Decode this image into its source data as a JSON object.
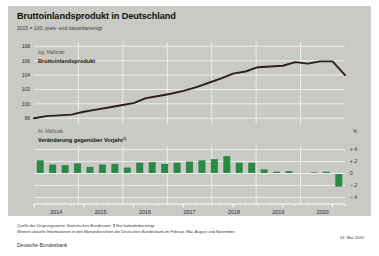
{
  "header": {
    "title": "Bruttoinlandsprodukt in Deutschland",
    "subtitle": "2015 = 100, preis- und saisonbereinigt"
  },
  "footer": {
    "source_prefix": "Quelle der Ursprungswerte: Statistisches Bundesamt.",
    "footnote_marker": "1",
    "footnote_text": "Nur kalenderbereinigt.",
    "source_line2": "Weitere aktuelle Informationen in den Monatsberichten der Deutschen Bundesbank im Februar, Mai, August und November.",
    "institution": "Deutsche Bundesbank",
    "date": "19. Mai 2020"
  },
  "colors": {
    "background": "#c9c9c5",
    "line": "#2b2119",
    "bar": "#2a8a45",
    "grid": "#f2f2ef",
    "page": "#ffffff"
  },
  "chart_data": [
    {
      "type": "line",
      "title": "Bruttoinlandsprodukt",
      "scale_note": "log. Maßstab",
      "series_label": "Bruttoinlandsprodukt",
      "ylabel": "",
      "xlabel": "",
      "ylim": [
        97.2,
        108.6
      ],
      "yticks": [
        98,
        100,
        102,
        104,
        106,
        108
      ],
      "ytick_labels": [
        "98",
        "100",
        "102",
        "104",
        "106",
        "108"
      ],
      "grid": true,
      "x": [
        "2013-Q4",
        "2014-Q1",
        "2014-Q2",
        "2014-Q3",
        "2014-Q4",
        "2015-Q1",
        "2015-Q2",
        "2015-Q3",
        "2015-Q4",
        "2016-Q1",
        "2016-Q2",
        "2016-Q3",
        "2016-Q4",
        "2017-Q1",
        "2017-Q2",
        "2017-Q3",
        "2017-Q4",
        "2018-Q1",
        "2018-Q2",
        "2018-Q3",
        "2018-Q4",
        "2019-Q1",
        "2019-Q2",
        "2019-Q3",
        "2019-Q4",
        "2020-Q1"
      ],
      "values": [
        98.0,
        98.3,
        98.4,
        98.5,
        98.9,
        99.2,
        99.5,
        99.8,
        100.1,
        100.8,
        101.1,
        101.4,
        101.8,
        102.3,
        102.9,
        103.5,
        104.2,
        104.5,
        105.1,
        105.2,
        105.3,
        105.8,
        105.6,
        105.9,
        105.9,
        104.0
      ]
    },
    {
      "type": "bar",
      "title": "Veränderung gegenüber Vorjahr",
      "scale_note": "lin. Maßstab",
      "series_label": "Veränderung gegenüber Vorjahr",
      "series_label_footnote": "1)",
      "ylabel": "%",
      "xlabel": "",
      "ylim": [
        -4.6,
        4.6
      ],
      "yticks": [
        -4,
        -2,
        0,
        2,
        4
      ],
      "ytick_labels": [
        "– 4",
        "– 2",
        "0",
        "+ 2",
        "+ 4"
      ],
      "grid": true,
      "categories": [
        "2014-Q1",
        "2014-Q2",
        "2014-Q3",
        "2014-Q4",
        "2015-Q1",
        "2015-Q2",
        "2015-Q3",
        "2015-Q4",
        "2016-Q1",
        "2016-Q2",
        "2016-Q3",
        "2016-Q4",
        "2017-Q1",
        "2017-Q2",
        "2017-Q3",
        "2017-Q4",
        "2018-Q1",
        "2018-Q2",
        "2018-Q3",
        "2018-Q4",
        "2019-Q1",
        "2019-Q2",
        "2019-Q3",
        "2019-Q4",
        "2020-Q1"
      ],
      "values": [
        2.2,
        1.5,
        1.4,
        1.7,
        1.1,
        1.5,
        1.6,
        1.0,
        1.8,
        1.9,
        1.6,
        1.8,
        2.0,
        2.2,
        2.4,
        2.9,
        1.8,
        1.8,
        0.7,
        0.3,
        0.4,
        0.1,
        0.2,
        0.3,
        -2.2
      ]
    }
  ],
  "xaxis": {
    "years": [
      "2014",
      "2015",
      "2016",
      "2017",
      "2018",
      "2019",
      "2020"
    ]
  }
}
